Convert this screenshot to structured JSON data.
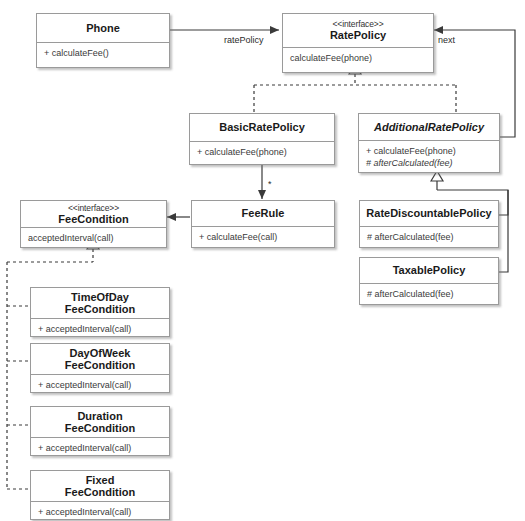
{
  "diagram": {
    "type": "uml-class-diagram",
    "classes": [
      {
        "id": "phone",
        "name": "Phone",
        "stereotype": "",
        "abstract": false,
        "members": [
          {
            "text": "+ calculateFee()",
            "abstract": false
          }
        ]
      },
      {
        "id": "ratePolicy",
        "name": "RatePolicy",
        "stereotype": "<<interface>>",
        "abstract": false,
        "members": [
          {
            "text": "calculateFee(phone)",
            "abstract": false
          }
        ]
      },
      {
        "id": "basicRatePolicy",
        "name": "BasicRatePolicy",
        "stereotype": "",
        "abstract": false,
        "members": [
          {
            "text": "+ calculateFee(phone)",
            "abstract": false
          }
        ]
      },
      {
        "id": "additionalRatePolicy",
        "name": "AdditionalRatePolicy",
        "stereotype": "",
        "abstract": true,
        "members": [
          {
            "text": "+ calculateFee(phone)",
            "abstract": false
          },
          {
            "text": "# afterCalculated(fee)",
            "abstract": true
          }
        ]
      },
      {
        "id": "feeCondition",
        "name": "FeeCondition",
        "stereotype": "<<interface>>",
        "abstract": false,
        "members": [
          {
            "text": "acceptedInterval(call)",
            "abstract": false
          }
        ]
      },
      {
        "id": "feeRule",
        "name": "FeeRule",
        "stereotype": "",
        "abstract": false,
        "members": [
          {
            "text": "+ calculateFee(call)",
            "abstract": false
          }
        ]
      },
      {
        "id": "rateDiscountablePolicy",
        "name": "RateDiscountablePolicy",
        "stereotype": "",
        "abstract": false,
        "members": [
          {
            "text": "# afterCalculated(fee)",
            "abstract": false
          }
        ]
      },
      {
        "id": "taxablePolicy",
        "name": "TaxablePolicy",
        "stereotype": "",
        "abstract": false,
        "members": [
          {
            "text": "# afterCalculated(fee)",
            "abstract": false
          }
        ]
      },
      {
        "id": "timeOfDayFeeCondition",
        "name": "TimeOfDay\nFeeCondition",
        "stereotype": "",
        "abstract": false,
        "members": [
          {
            "text": "+ acceptedInterval(call)",
            "abstract": false
          }
        ]
      },
      {
        "id": "dayOfWeekFeeCondition",
        "name": "DayOfWeek\nFeeCondition",
        "stereotype": "",
        "abstract": false,
        "members": [
          {
            "text": "+ acceptedInterval(call)",
            "abstract": false
          }
        ]
      },
      {
        "id": "durationFeeCondition",
        "name": "Duration\nFeeCondition",
        "stereotype": "",
        "abstract": false,
        "members": [
          {
            "text": "+ acceptedInterval(call)",
            "abstract": false
          }
        ]
      },
      {
        "id": "fixedFeeCondition",
        "name": "Fixed\nFeeCondition",
        "stereotype": "",
        "abstract": false,
        "members": [
          {
            "text": "+ acceptedInterval(call)",
            "abstract": false
          }
        ]
      }
    ],
    "edge_labels": {
      "ratePolicy_role": "ratePolicy",
      "next_role": "next",
      "feeRule_multiplicity": "*"
    },
    "colors": {
      "box_border": "#9a9a9a",
      "box_fill": "#ffffff",
      "line": "#3a3a3a",
      "text": "#1a1a1a",
      "member_text": "#3a3a3a"
    }
  }
}
